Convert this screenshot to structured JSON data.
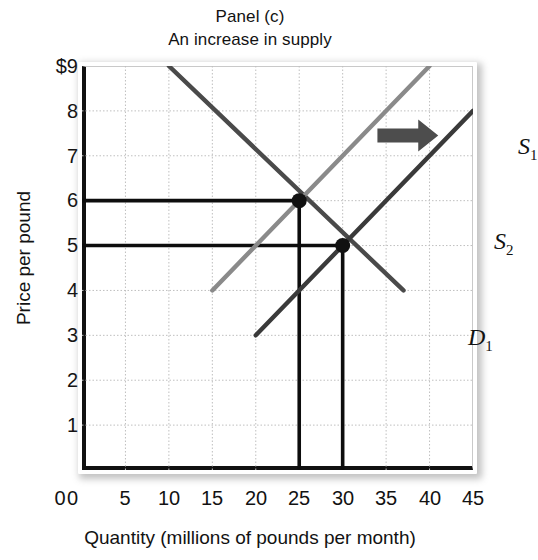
{
  "chart_data": {
    "type": "line",
    "title": "Panel (c)",
    "subtitle": "An increase in supply",
    "xlabel": "Quantity (millions of pounds per month)",
    "ylabel": "Price per pound",
    "xlim": [
      0,
      45
    ],
    "ylim": [
      0,
      9
    ],
    "xticks": [
      "0",
      "5",
      "10",
      "15",
      "20",
      "25",
      "30",
      "35",
      "40",
      "45"
    ],
    "yticks": [
      "$9",
      "8",
      "7",
      "6",
      "5",
      "4",
      "3",
      "2",
      "1",
      "0"
    ],
    "grid": true,
    "legend": "inline-curve-labels",
    "series": [
      {
        "name": "D1",
        "label": "D",
        "sub": "1",
        "role": "demand",
        "color": "#4a4a4a",
        "points": [
          [
            10,
            9
          ],
          [
            37,
            4
          ]
        ]
      },
      {
        "name": "S1",
        "label": "S",
        "sub": "1",
        "role": "supply-original",
        "color": "#8a8a8a",
        "points": [
          [
            15,
            4
          ],
          [
            40,
            9
          ]
        ]
      },
      {
        "name": "S2",
        "label": "S",
        "sub": "2",
        "role": "supply-shifted",
        "color": "#3a3a3a",
        "points": [
          [
            20,
            3
          ],
          [
            45,
            8
          ]
        ]
      }
    ],
    "equilibria": [
      {
        "name": "original-equilibrium",
        "quantity": 25,
        "price": 6
      },
      {
        "name": "new-equilibrium",
        "quantity": 30,
        "price": 5
      }
    ],
    "reference_lines": {
      "horizontal_prices": [
        6,
        5
      ],
      "vertical_quantities": [
        25,
        30
      ]
    },
    "annotation_arrow": {
      "name": "supply-shift-arrow",
      "direction": "right",
      "from_quantity": 34,
      "to_quantity": 41,
      "price": 7.45,
      "color": "#4d4d4d"
    },
    "colors": {
      "axis": "#111111",
      "grid": "#bfbfbf",
      "frame": "#c9c9c9",
      "reference_line": "#0d0d0d",
      "marker": "#111111"
    }
  }
}
